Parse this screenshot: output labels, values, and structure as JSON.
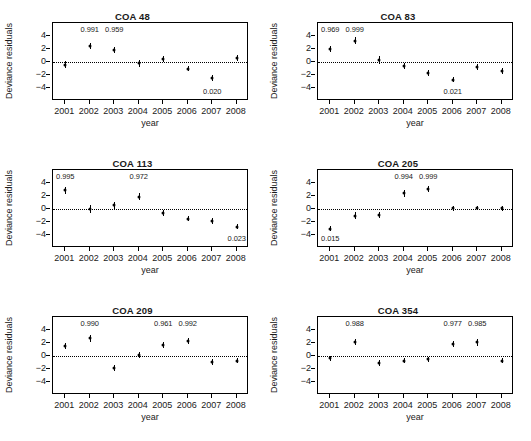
{
  "figure": {
    "axis_titles": {
      "x": "year",
      "y": "Deviance residuals"
    },
    "y_ticks": [
      "4",
      "2",
      "0",
      "−2",
      "−4"
    ],
    "y_tick_values": [
      4,
      2,
      0,
      -2,
      -4
    ],
    "ylim": [
      -6,
      6
    ],
    "x_ticks": [
      "2001",
      "2002",
      "2003",
      "2004",
      "2005",
      "2006",
      "2007",
      "2008"
    ]
  },
  "chart_data": {
    "type": "scatter",
    "xlabel": "year",
    "ylabel": "Deviance residuals",
    "x": [
      2001,
      2002,
      2003,
      2004,
      2005,
      2006,
      2007,
      2008
    ],
    "ylim": [
      -6,
      6
    ],
    "y_ticks": [
      -4,
      -2,
      0,
      2,
      4
    ],
    "grid": false,
    "legend": "none",
    "reference_line": {
      "y": 0,
      "style": "dotted"
    },
    "panels": [
      {
        "title": "COA 48",
        "values": [
          -0.45,
          2.5,
          1.85,
          -0.2,
          0.5,
          -1.0,
          -2.5,
          0.65
        ],
        "errors": [
          0.55,
          0.5,
          0.5,
          0.5,
          0.45,
          0.45,
          0.45,
          0.5
        ],
        "annotations": [
          {
            "x": 2002,
            "text": "0.991",
            "position": "top"
          },
          {
            "x": 2003,
            "text": "0.959",
            "position": "top"
          },
          {
            "x": 2007,
            "text": "0.020",
            "position": "bottom"
          }
        ]
      },
      {
        "title": "COA 83",
        "values": [
          2.0,
          3.3,
          0.3,
          -0.65,
          -1.75,
          -2.7,
          -0.8,
          -1.4
        ],
        "errors": [
          0.5,
          0.6,
          0.55,
          0.45,
          0.45,
          0.45,
          0.45,
          0.45
        ],
        "annotations": [
          {
            "x": 2001,
            "text": "0.969",
            "position": "top"
          },
          {
            "x": 2002,
            "text": "0.999",
            "position": "top"
          },
          {
            "x": 2006,
            "text": "0.021",
            "position": "bottom"
          }
        ]
      },
      {
        "title": "COA 113",
        "values": [
          2.85,
          -0.05,
          0.55,
          1.9,
          -0.65,
          -1.5,
          -1.85,
          -2.7
        ],
        "errors": [
          0.5,
          0.6,
          0.5,
          0.5,
          0.45,
          0.4,
          0.45,
          0.45
        ],
        "annotations": [
          {
            "x": 2001,
            "text": "0.995",
            "position": "top"
          },
          {
            "x": 2004,
            "text": "0.972",
            "position": "top"
          },
          {
            "x": 2008,
            "text": "0.023",
            "position": "bottom"
          }
        ]
      },
      {
        "title": "COA 205",
        "values": [
          -3.0,
          -1.0,
          -0.9,
          2.4,
          3.1,
          0.1,
          0.15,
          0.1
        ],
        "errors": [
          0.45,
          0.6,
          0.5,
          0.5,
          0.45,
          0.35,
          0.35,
          0.35
        ],
        "annotations": [
          {
            "x": 2004,
            "text": "0.994",
            "position": "top"
          },
          {
            "x": 2005,
            "text": "0.999",
            "position": "top"
          },
          {
            "x": 2001,
            "text": "0.015",
            "position": "bottom"
          }
        ]
      },
      {
        "title": "COA 209",
        "values": [
          1.55,
          2.7,
          -1.8,
          0.2,
          1.65,
          2.3,
          -0.95,
          -0.7
        ],
        "errors": [
          0.45,
          0.5,
          0.45,
          0.45,
          0.45,
          0.45,
          0.45,
          0.45
        ],
        "annotations": [
          {
            "x": 2002,
            "text": "0.990",
            "position": "top"
          },
          {
            "x": 2005,
            "text": "0.961",
            "position": "top"
          },
          {
            "x": 2006,
            "text": "0.992",
            "position": "top"
          }
        ]
      },
      {
        "title": "COA 354",
        "values": [
          -0.35,
          2.15,
          -1.05,
          -0.75,
          -0.5,
          1.8,
          2.1,
          -0.7
        ],
        "errors": [
          0.4,
          0.5,
          0.45,
          0.4,
          0.4,
          0.45,
          0.5,
          0.45
        ],
        "annotations": [
          {
            "x": 2002,
            "text": "0.988",
            "position": "top"
          },
          {
            "x": 2006,
            "text": "0.977",
            "position": "top"
          },
          {
            "x": 2007,
            "text": "0.985",
            "position": "top"
          }
        ]
      }
    ]
  }
}
